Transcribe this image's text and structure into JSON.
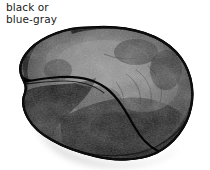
{
  "figure": {
    "kind": "botanical-seed-illustration",
    "background_color": "#ffffff",
    "caption": {
      "text": "black or\nblue-gray",
      "lines": [
        "black or",
        "blue-gray"
      ],
      "color": "#1a1a1a",
      "position": "top-left"
    },
    "seed": {
      "name": "seed-body",
      "outline_color": "#0d0d0d",
      "fill_dark": "#141414",
      "fill_mid": "#4a4a4a",
      "fill_light": "#8d8d8d",
      "fill_highlight": "#b4b4b4",
      "shadow_color": "#e2e2e2",
      "hilum_color": "#050505",
      "bounds": {
        "x": 20,
        "y": 27,
        "width": 175,
        "height": 134
      },
      "parts": [
        {
          "label": "outer-rim",
          "description": "dark thick margin around entire seed"
        },
        {
          "label": "hilum-scar",
          "description": "curved dark line running from left edge toward the lower middle"
        },
        {
          "label": "mottled-body",
          "description": "grainy gray-to-black surface mottling"
        },
        {
          "label": "drop-shadow",
          "description": "pale gray cast shadow under lower-left margin"
        }
      ]
    }
  }
}
